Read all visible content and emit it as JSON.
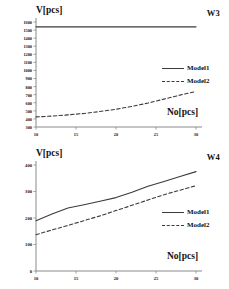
{
  "figure": {
    "panels": [
      {
        "id": "w3",
        "corner_label": "W3",
        "ytitle": "V[pcs]",
        "xtitle": "No[pcs]"
      },
      {
        "id": "w4",
        "corner_label": "W4",
        "ytitle": "V[pcs]",
        "xtitle": "No[pcs]"
      }
    ],
    "legend": {
      "model1": "Model1",
      "model2": "Model2"
    },
    "colors": {
      "line": "#3a3a3a",
      "axis": "#8a8a8a",
      "text": "#111111",
      "background": "#ffffff"
    }
  },
  "chart_data": [
    {
      "type": "line",
      "title": "W3",
      "xlabel": "No[pcs]",
      "ylabel": "V[pcs]",
      "xlim": [
        10,
        30
      ],
      "ylim": [
        300,
        1600
      ],
      "xticks": [
        10,
        15,
        20,
        25,
        30
      ],
      "yticks": [
        300,
        400,
        500,
        600,
        700,
        800,
        900,
        1000,
        1100,
        1200,
        1300,
        1400,
        1500,
        1600
      ],
      "grid": false,
      "legend_position": "right",
      "x": [
        10,
        12,
        14,
        16,
        18,
        20,
        22,
        24,
        26,
        28,
        30
      ],
      "series": [
        {
          "name": "Model1",
          "style": "solid",
          "values": [
            1540,
            1540,
            1540,
            1540,
            1540,
            1540,
            1540,
            1540,
            1540,
            1540,
            1540
          ]
        },
        {
          "name": "Model2",
          "style": "dashed",
          "values": [
            425,
            435,
            450,
            468,
            492,
            520,
            555,
            597,
            645,
            695,
            740
          ]
        }
      ]
    },
    {
      "type": "line",
      "title": "W4",
      "xlabel": "No[pcs]",
      "ylabel": "V[pcs]",
      "xlim": [
        10,
        30
      ],
      "ylim": [
        0,
        400
      ],
      "xticks": [
        10,
        15,
        20,
        25,
        30
      ],
      "yticks": [
        0,
        100,
        200,
        300,
        400
      ],
      "grid": false,
      "legend_position": "right",
      "x": [
        10,
        12,
        14,
        16,
        18,
        20,
        22,
        24,
        26,
        28,
        30
      ],
      "series": [
        {
          "name": "Model1",
          "style": "solid",
          "values": [
            190,
            215,
            238,
            250,
            263,
            277,
            297,
            320,
            338,
            357,
            375
          ]
        },
        {
          "name": "Model2",
          "style": "dashed",
          "values": [
            137,
            155,
            172,
            190,
            208,
            228,
            248,
            268,
            288,
            305,
            322
          ]
        }
      ]
    }
  ]
}
